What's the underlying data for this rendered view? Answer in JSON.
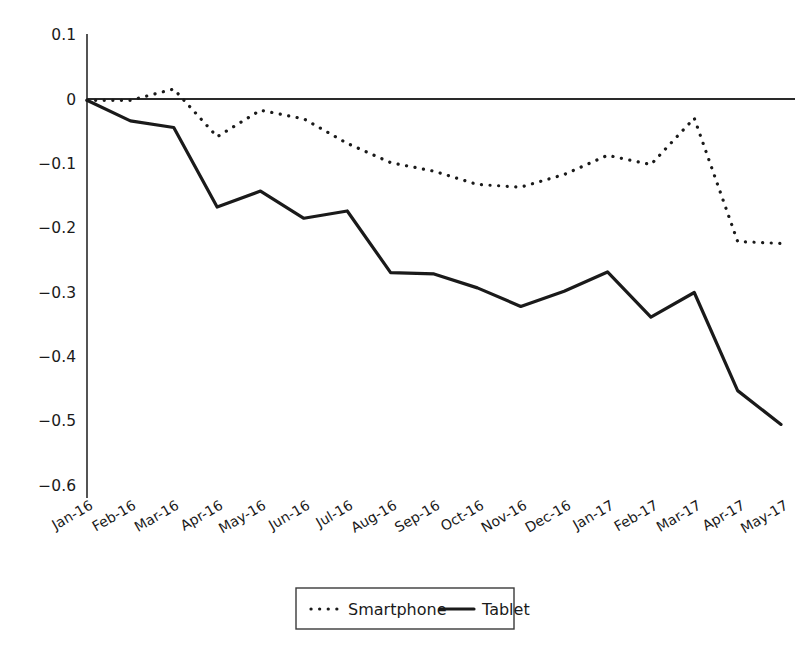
{
  "chart_data": {
    "type": "line",
    "title": "",
    "xlabel": "",
    "ylabel": "",
    "categories": [
      "Jan-16",
      "Feb-16",
      "Mar-16",
      "Apr-16",
      "May-16",
      "Jun-16",
      "Jul-16",
      "Aug-16",
      "Sep-16",
      "Oct-16",
      "Nov-16",
      "Dec-16",
      "Jan-17",
      "Feb-17",
      "Mar-17",
      "Apr-17",
      "May-17"
    ],
    "series": [
      {
        "name": "Smartphone",
        "style": "dotted",
        "color": "#1a1a1a",
        "values": [
          0,
          0,
          0.017,
          -0.055,
          -0.015,
          -0.028,
          -0.065,
          -0.094,
          -0.107,
          -0.127,
          -0.131,
          -0.112,
          -0.083,
          -0.097,
          -0.027,
          -0.213,
          -0.216
        ]
      },
      {
        "name": "Tablet",
        "style": "solid",
        "color": "#1a1a1a",
        "values": [
          0,
          -0.031,
          -0.041,
          -0.161,
          -0.137,
          -0.178,
          -0.167,
          -0.26,
          -0.262,
          -0.283,
          -0.311,
          -0.288,
          -0.259,
          -0.327,
          -0.29,
          -0.438,
          -0.489
        ]
      }
    ],
    "yticks": [
      0.1,
      0,
      -0.1,
      -0.2,
      -0.3,
      -0.4,
      -0.5,
      -0.6
    ],
    "ytick_labels": [
      "0.1",
      "0",
      "−0.1",
      "−0.2",
      "−0.3",
      "−0.4",
      "−0.5",
      "−0.6"
    ],
    "ylim": [
      -0.6,
      0.1
    ],
    "grid": false,
    "legend": {
      "position": "bottom",
      "entries": [
        {
          "label": "Smartphone",
          "marker": "dotted-line"
        },
        {
          "label": "Tablet",
          "marker": "solid-line"
        }
      ]
    }
  }
}
